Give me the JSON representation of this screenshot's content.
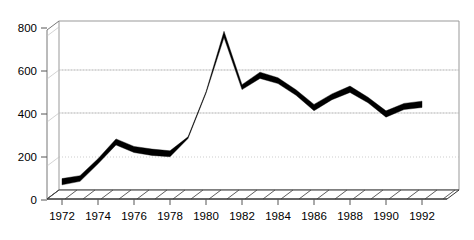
{
  "chart_data": {
    "type": "line",
    "title": "",
    "subtitle": "",
    "xlabel": "",
    "ylabel": "",
    "style": "3d-ribbon-line",
    "grid": true,
    "legend": null,
    "xlim": [
      1972,
      1992
    ],
    "ylim": [
      0,
      850
    ],
    "ytick_values": [
      0,
      200,
      400,
      600,
      800
    ],
    "ytick_labels": [
      "0",
      "200",
      "400",
      "600",
      "800"
    ],
    "xtick_values": [
      1972,
      1974,
      1976,
      1978,
      1980,
      1982,
      1984,
      1986,
      1988,
      1990,
      1992
    ],
    "xtick_labels": [
      "1972",
      "1974",
      "1976",
      "1978",
      "1980",
      "1982",
      "1984",
      "1986",
      "1988",
      "1990",
      "1992"
    ],
    "x": [
      1972,
      1973,
      1974,
      1975,
      1976,
      1977,
      1978,
      1979,
      1980,
      1981,
      1982,
      1983,
      1984,
      1985,
      1986,
      1987,
      1988,
      1989,
      1990,
      1991,
      1992
    ],
    "values": [
      85,
      100,
      180,
      270,
      235,
      222,
      215,
      290,
      500,
      770,
      525,
      580,
      555,
      500,
      430,
      480,
      515,
      465,
      400,
      435,
      445
    ],
    "series": [
      {
        "name": "series-1",
        "color": "#000000",
        "values": [
          85,
          100,
          180,
          270,
          235,
          222,
          215,
          290,
          500,
          770,
          525,
          580,
          555,
          500,
          430,
          480,
          515,
          465,
          400,
          435,
          445
        ]
      }
    ],
    "colors": {
      "line": "#000000",
      "grid": "#b8b8b8",
      "axis": "#777777",
      "frame": "#999999",
      "floor": "#4a4a4a",
      "background": "#ffffff",
      "text": "#000000"
    }
  }
}
